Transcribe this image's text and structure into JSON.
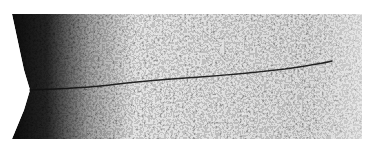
{
  "image": {
    "subject": "micrograph-crack-from-notch",
    "description": "Grayscale speckled specimen texture with a dark V-notch on the left edge and a thin crack propagating rightward",
    "colors": {
      "background": "#ffffff",
      "specimen_light": "#e8e8e8",
      "specimen_dark": "#1a1a1a",
      "crack": "#111111"
    },
    "geometry": {
      "specimen_box": [
        12,
        14,
        362,
        139
      ],
      "notch_tip": [
        30,
        90
      ],
      "crack_path": [
        [
          30,
          90
        ],
        [
          80,
          88
        ],
        [
          140,
          80
        ],
        [
          200,
          77
        ],
        [
          260,
          72
        ],
        [
          300,
          67
        ],
        [
          330,
          62
        ]
      ]
    }
  }
}
